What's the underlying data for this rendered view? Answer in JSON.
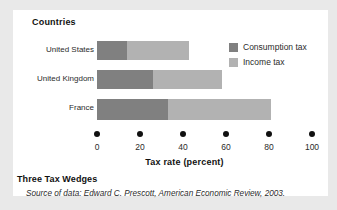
{
  "figure": {
    "title": "Three Tax Wedges",
    "source": {
      "prefix": "Source of data:",
      "author": "Edward C. Prescott,",
      "journal": "American Economic Review,",
      "year": "2003."
    }
  },
  "colors": {
    "consumption_tax": "#808080",
    "income_tax": "#b2b2b2",
    "axis": "#111111",
    "panel": "#ffffff",
    "page": "#e9e9e9"
  },
  "chart_data": {
    "type": "bar",
    "orientation": "horizontal",
    "stacked": true,
    "title": "Three Tax Wedges",
    "group_header": "Countries",
    "xlabel": "Tax rate (percent)",
    "ylabel": "Countries",
    "xlim": [
      0,
      100
    ],
    "xticks": [
      0,
      20,
      40,
      60,
      80,
      100
    ],
    "xticklabels": [
      "0",
      "20",
      "40",
      "60",
      "80",
      "100"
    ],
    "grid": false,
    "legend_position": "right",
    "categories": [
      "United States",
      "United Kingdom",
      "France"
    ],
    "series": [
      {
        "name": "Consumption tax",
        "color": "#808080",
        "values": [
          14,
          26,
          33
        ]
      },
      {
        "name": "Income tax",
        "color": "#b2b2b2",
        "values": [
          29,
          32,
          48
        ]
      }
    ],
    "totals": [
      43,
      58,
      81
    ]
  }
}
